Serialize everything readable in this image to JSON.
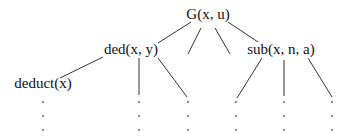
{
  "diagram": {
    "type": "tree",
    "nodes": [
      {
        "id": "root",
        "label": "G(x, u)",
        "x": 208,
        "y": 19
      },
      {
        "id": "ded",
        "label": "ded(x, y)",
        "x": 131,
        "y": 54
      },
      {
        "id": "sub",
        "label": "sub(x, n, a)",
        "x": 281,
        "y": 54
      },
      {
        "id": "deduct",
        "label": "deduct(x)",
        "x": 43,
        "y": 88
      }
    ],
    "edges": [
      {
        "from": "root",
        "to": "ded",
        "x1": 191,
        "y1": 22,
        "x2": 158,
        "y2": 43
      },
      {
        "from": "root",
        "to": "unlabeled-1",
        "x1": 201,
        "y1": 28,
        "x2": 188,
        "y2": 54
      },
      {
        "from": "root",
        "to": "unlabeled-2",
        "x1": 215,
        "y1": 28,
        "x2": 230,
        "y2": 54
      },
      {
        "from": "root",
        "to": "sub",
        "x1": 228,
        "y1": 22,
        "x2": 258,
        "y2": 42
      },
      {
        "from": "ded",
        "to": "deduct",
        "x1": 103,
        "y1": 57,
        "x2": 60,
        "y2": 78
      },
      {
        "from": "ded",
        "to": "ellipsis-col-2",
        "x1": 139,
        "y1": 58,
        "x2": 139,
        "y2": 95
      },
      {
        "from": "ded",
        "to": "ellipsis-col-3",
        "x1": 158,
        "y1": 58,
        "x2": 187,
        "y2": 97
      },
      {
        "from": "sub",
        "to": "ellipsis-col-4",
        "x1": 262,
        "y1": 58,
        "x2": 237,
        "y2": 98
      },
      {
        "from": "sub",
        "to": "ellipsis-col-5",
        "x1": 284,
        "y1": 60,
        "x2": 284,
        "y2": 96
      },
      {
        "from": "sub",
        "to": "ellipsis-col-6",
        "x1": 308,
        "y1": 58,
        "x2": 332,
        "y2": 97
      }
    ],
    "ellipsis_columns": [
      43,
      139,
      188,
      236,
      284,
      332
    ],
    "ellipsis_rows": [
      102,
      116,
      130
    ]
  }
}
